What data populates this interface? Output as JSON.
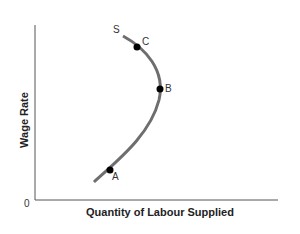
{
  "diagram": {
    "title": "",
    "y_axis_label": "Wage Rate",
    "x_axis_label": "Quantity of Labour Supplied",
    "origin_label": "0",
    "curve_label": "S",
    "points": [
      {
        "label": "A"
      },
      {
        "label": "B"
      },
      {
        "label": "C"
      }
    ],
    "colors": {
      "curve": "#6e6e6e",
      "points": "#000000",
      "axes": "#555555"
    }
  }
}
